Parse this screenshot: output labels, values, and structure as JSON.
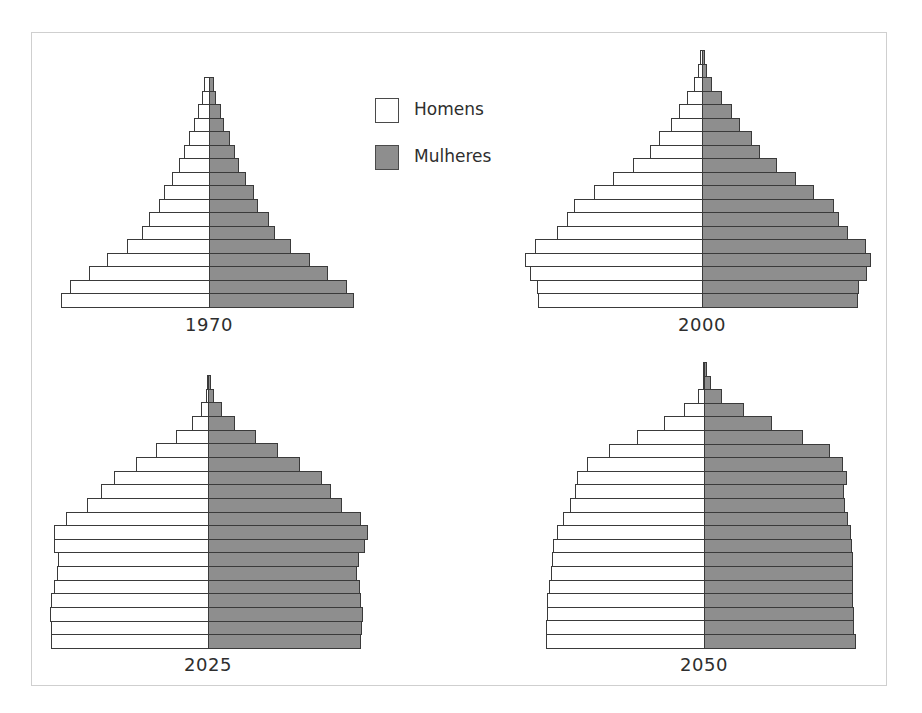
{
  "legend": {
    "male_label": "Homens",
    "female_label": "Mulheres",
    "male_color": "#ffffff",
    "female_color": "#8e8e8e"
  },
  "colors": {
    "border": "#3a3a3a",
    "frame": "#cfcfcf",
    "text": "#2e2e2e"
  },
  "chart_data": [
    {
      "type": "bar",
      "subtype": "population-pyramid",
      "title": "1970",
      "series": [
        {
          "name": "Homens",
          "values": [
            5,
            7,
            11,
            15,
            20,
            25,
            30,
            37,
            45,
            50,
            60,
            67,
            82,
            102,
            120,
            139,
            148
          ]
        },
        {
          "name": "Mulheres",
          "values": [
            4,
            6,
            11,
            14,
            20,
            25,
            29,
            36,
            44,
            48,
            59,
            65,
            81,
            100,
            118,
            137,
            144
          ]
        }
      ],
      "categories_order": "top = oldest age group, bottom = youngest",
      "units": "relative bar length (px)",
      "layout": {
        "center_x": 209,
        "top_y": 77,
        "row_h": 13.5,
        "label_y": 314
      }
    },
    {
      "type": "bar",
      "subtype": "population-pyramid",
      "title": "2000",
      "series": [
        {
          "name": "Homens",
          "values": [
            2,
            4,
            8,
            15,
            23,
            31,
            43,
            52,
            69,
            89,
            108,
            128,
            135,
            145,
            167,
            177,
            172,
            165,
            164
          ]
        },
        {
          "name": "Mulheres",
          "values": [
            2,
            4,
            9,
            19,
            29,
            37,
            49,
            57,
            74,
            93,
            111,
            131,
            136,
            145,
            163,
            168,
            164,
            156,
            155
          ]
        }
      ],
      "categories_order": "top = oldest age group, bottom = youngest",
      "units": "relative bar length (px)",
      "layout": {
        "center_x": 702,
        "top_y": 50,
        "row_h": 13.5,
        "label_y": 314
      }
    },
    {
      "type": "bar",
      "subtype": "population-pyramid",
      "title": "2025",
      "series": [
        {
          "name": "Homens",
          "values": [
            1,
            2,
            7,
            16,
            32,
            52,
            72,
            94,
            107,
            121,
            142,
            154,
            154,
            150,
            151,
            154,
            157,
            158,
            157,
            157
          ]
        },
        {
          "name": "Mulheres",
          "values": [
            2,
            5,
            13,
            26,
            47,
            69,
            91,
            113,
            122,
            133,
            152,
            159,
            156,
            150,
            148,
            151,
            152,
            154,
            153,
            152
          ]
        }
      ],
      "categories_order": "top = oldest age group, bottom = youngest",
      "units": "relative bar length (px)",
      "layout": {
        "center_x": 208,
        "top_y": 375,
        "row_h": 13.65,
        "label_y": 654
      }
    },
    {
      "type": "bar",
      "subtype": "population-pyramid",
      "title": "2050",
      "series": [
        {
          "name": "Homens",
          "values": [
            1,
            1,
            6,
            20,
            40,
            67,
            95,
            117,
            127,
            129,
            134,
            141,
            147,
            151,
            152,
            153,
            155,
            157,
            157,
            158,
            158
          ]
        },
        {
          "name": "Mulheres",
          "values": [
            2,
            6,
            17,
            39,
            67,
            98,
            125,
            138,
            142,
            139,
            140,
            143,
            146,
            147,
            148,
            148,
            148,
            148,
            149,
            149,
            151
          ]
        }
      ],
      "categories_order": "top = oldest age group, bottom = youngest",
      "units": "relative bar length (px)",
      "layout": {
        "center_x": 704,
        "top_y": 362,
        "row_h": 13.6,
        "label_y": 654
      }
    }
  ]
}
